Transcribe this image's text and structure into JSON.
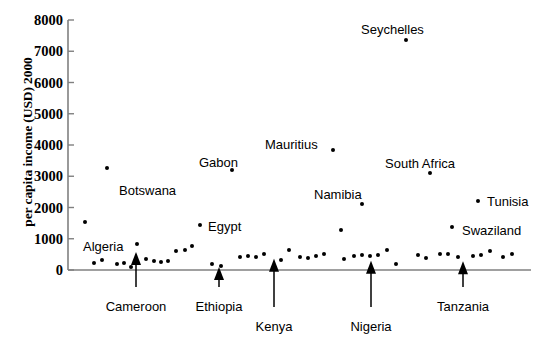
{
  "chart_data": {
    "type": "scatter",
    "title": "",
    "xlabel": "",
    "ylabel": "per capita income (USD) 2000",
    "ylim": [
      0,
      8000
    ],
    "ytick_labels": [
      "8000",
      "7000",
      "6000",
      "5000",
      "4000",
      "3000",
      "2000",
      "1000",
      "0"
    ],
    "ytick_values": [
      8000,
      7000,
      6000,
      5000,
      4000,
      3000,
      2000,
      1000,
      0
    ],
    "grid": false,
    "legend": "none",
    "xaxis_visible_ticks": false,
    "point_color": "#000000",
    "axis_color": "#808080",
    "labeled_points": [
      {
        "label": "Algeria",
        "x": 85,
        "value": 1550,
        "label_dx": -2,
        "label_dy": 24,
        "label_anchor": "left"
      },
      {
        "label": "Botswana",
        "x": 107,
        "value": 3250,
        "label_dx": 12,
        "label_dy": 22,
        "label_anchor": "left"
      },
      {
        "label": "Gabon",
        "x": 232,
        "value": 3200,
        "label_dx": -33,
        "label_dy": -8,
        "label_anchor": "left"
      },
      {
        "label": "Egypt",
        "x": 200,
        "value": 1450,
        "label_dx": 8,
        "label_dy": 1,
        "label_anchor": "left"
      },
      {
        "label": "Mauritius",
        "x": 333,
        "value": 3850,
        "label_dx": -68,
        "label_dy": -6,
        "label_anchor": "left"
      },
      {
        "label": "Seychelles",
        "x": 406,
        "value": 7350,
        "label_dx": -45,
        "label_dy": -11,
        "label_anchor": "left"
      },
      {
        "label": "Namibia",
        "x": 362,
        "value": 2100,
        "label_dx": -48,
        "label_dy": -10,
        "label_anchor": "left"
      },
      {
        "label": "South Africa",
        "x": 430,
        "value": 3100,
        "label_dx": -45,
        "label_dy": -10,
        "label_anchor": "left"
      },
      {
        "label": "Tunisia",
        "x": 478,
        "value": 2200,
        "label_dx": 9,
        "label_dy": 0,
        "label_anchor": "left"
      },
      {
        "label": "Swaziland",
        "x": 452,
        "value": 1380,
        "label_dx": 10,
        "label_dy": 3,
        "label_anchor": "left"
      }
    ],
    "arrow_points": [
      {
        "label": "Cameroon",
        "x": 136,
        "value": 580,
        "label_y": 300
      },
      {
        "label": "Ethiopia",
        "x": 219,
        "value": 95,
        "label_y": 300
      },
      {
        "label": "Kenya",
        "x": 274,
        "value": 360,
        "label_y": 320
      },
      {
        "label": "Nigeria",
        "x": 371,
        "value": 300,
        "label_y": 320
      },
      {
        "label": "Tanzania",
        "x": 463,
        "value": 280,
        "label_y": 300
      }
    ],
    "unlabeled_points": [
      {
        "x": 94,
        "value": 220
      },
      {
        "x": 102,
        "value": 330
      },
      {
        "x": 117,
        "value": 200
      },
      {
        "x": 124,
        "value": 230
      },
      {
        "x": 131,
        "value": 110
      },
      {
        "x": 137,
        "value": 830
      },
      {
        "x": 146,
        "value": 350
      },
      {
        "x": 154,
        "value": 290
      },
      {
        "x": 161,
        "value": 260
      },
      {
        "x": 168,
        "value": 290
      },
      {
        "x": 176,
        "value": 620
      },
      {
        "x": 185,
        "value": 640
      },
      {
        "x": 192,
        "value": 760
      },
      {
        "x": 212,
        "value": 180
      },
      {
        "x": 221,
        "value": 130
      },
      {
        "x": 240,
        "value": 420
      },
      {
        "x": 248,
        "value": 450
      },
      {
        "x": 256,
        "value": 430
      },
      {
        "x": 264,
        "value": 510
      },
      {
        "x": 281,
        "value": 330
      },
      {
        "x": 289,
        "value": 630
      },
      {
        "x": 300,
        "value": 430
      },
      {
        "x": 308,
        "value": 390
      },
      {
        "x": 316,
        "value": 440
      },
      {
        "x": 324,
        "value": 520
      },
      {
        "x": 344,
        "value": 350
      },
      {
        "x": 354,
        "value": 450
      },
      {
        "x": 362,
        "value": 480
      },
      {
        "x": 370,
        "value": 460
      },
      {
        "x": 378,
        "value": 480
      },
      {
        "x": 387,
        "value": 650
      },
      {
        "x": 396,
        "value": 200
      },
      {
        "x": 418,
        "value": 470
      },
      {
        "x": 426,
        "value": 380
      },
      {
        "x": 440,
        "value": 520
      },
      {
        "x": 448,
        "value": 500
      },
      {
        "x": 458,
        "value": 430
      },
      {
        "x": 473,
        "value": 440
      },
      {
        "x": 481,
        "value": 470
      },
      {
        "x": 490,
        "value": 610
      },
      {
        "x": 503,
        "value": 430
      },
      {
        "x": 512,
        "value": 510
      },
      {
        "x": 341,
        "value": 1270
      }
    ]
  }
}
